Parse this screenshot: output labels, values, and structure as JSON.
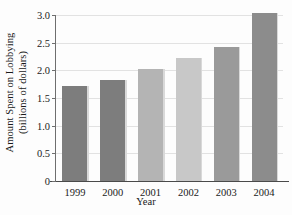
{
  "chart_data": {
    "type": "bar",
    "title": "",
    "xlabel": "Year",
    "ylabel_line1": "Amount Spent on Lobbying",
    "ylabel_line2": "(billions of dollars)",
    "categories": [
      "1999",
      "2000",
      "2001",
      "2002",
      "2003",
      "2004"
    ],
    "values": [
      1.72,
      1.82,
      2.03,
      2.22,
      2.43,
      3.03
    ],
    "bar_colors": [
      "#7d7d7d",
      "#7d7d7d",
      "#b4b4b4",
      "#c8c8c8",
      "#9a9a9a",
      "#8c8c8c"
    ],
    "ylim": [
      0,
      3.0
    ],
    "yticks": [
      0,
      0.5,
      1.0,
      1.5,
      2.0,
      2.5,
      3.0
    ],
    "ytick_labels": [
      "0",
      "0.5",
      "1.0",
      "1.5",
      "2.0",
      "2.5",
      "3.0"
    ],
    "grid": true,
    "grid_axis": "y",
    "legend": "none",
    "axis_color": "#6e6e6e",
    "grid_color": "#e2e2e2",
    "background": "#fdfdfd"
  }
}
